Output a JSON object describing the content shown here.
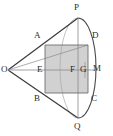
{
  "figure": {
    "kind": "geometry-diagram",
    "colors": {
      "stroke": "#3a3a3a",
      "thin_stroke": "#7a7a7a",
      "shade_fill": "#c9c9c9",
      "background": "#ffffff",
      "label": "#2b2b2b"
    },
    "points": [
      {
        "id": "O",
        "label": "O",
        "x": 8,
        "y": 70,
        "lx": 1,
        "ly": 65
      },
      {
        "id": "P",
        "label": "P",
        "x": 78,
        "y": 18,
        "lx": 74,
        "ly": 3
      },
      {
        "id": "Q",
        "label": "Q",
        "x": 78,
        "y": 118,
        "lx": 74,
        "ly": 122
      },
      {
        "id": "A",
        "label": "A",
        "x": 45,
        "y": 45,
        "lx": 34,
        "ly": 31
      },
      {
        "id": "B",
        "label": "B",
        "x": 45,
        "y": 93,
        "lx": 34,
        "ly": 94
      },
      {
        "id": "C",
        "label": "C",
        "x": 88,
        "y": 93,
        "lx": 91,
        "ly": 94
      },
      {
        "id": "D",
        "label": "D",
        "x": 88,
        "y": 45,
        "lx": 92,
        "ly": 31
      },
      {
        "id": "E",
        "label": "E",
        "x": 45,
        "y": 70,
        "lx": 37,
        "ly": 65
      },
      {
        "id": "F",
        "label": "F",
        "x": 78,
        "y": 70,
        "lx": 70,
        "ly": 65
      },
      {
        "id": "G",
        "label": "G",
        "x": 85,
        "y": 70,
        "lx": 80,
        "ly": 65
      },
      {
        "id": "M",
        "label": "M",
        "x": 96,
        "y": 70,
        "lx": 93,
        "ly": 64
      }
    ],
    "rectangle": {
      "name": "ABCD",
      "x": 45,
      "y": 45,
      "width": 43,
      "height": 48
    },
    "arc": {
      "name": "base-ellipse",
      "cx": 78,
      "cy": 68,
      "rx": 18,
      "ry": 50
    },
    "segments": [
      "O-P",
      "O-Q",
      "O-A",
      "O-D",
      "O-M",
      "P-Q",
      "A-D",
      "B-C",
      "A-B",
      "D-C",
      "E-M"
    ]
  }
}
